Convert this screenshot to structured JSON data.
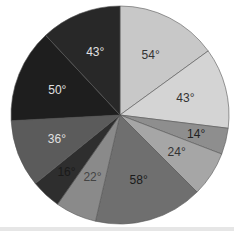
{
  "chart_data": {
    "type": "pie",
    "title": "",
    "unit": "°",
    "start_angle_deg": 0,
    "direction": "clockwise",
    "center": [
      120,
      115
    ],
    "radius": 109,
    "slices": [
      {
        "label": "54°",
        "value": 54,
        "color": "#c8c8c8",
        "text_color": "#333333"
      },
      {
        "label": "43°",
        "value": 43,
        "color": "#d4d4d4",
        "text_color": "#333333"
      },
      {
        "label": "14°",
        "value": 14,
        "color": "#8e8e8e",
        "text_color": "#222222"
      },
      {
        "label": "24°",
        "value": 24,
        "color": "#a6a6a6",
        "text_color": "#333333"
      },
      {
        "label": "58°",
        "value": 58,
        "color": "#6f6f6f",
        "text_color": "#1a1a1a"
      },
      {
        "label": "22°",
        "value": 22,
        "color": "#8a8a8a",
        "text_color": "#444444"
      },
      {
        "label": "16°",
        "value": 16,
        "color": "#2e2e2e",
        "text_color": "#1a1a1a"
      },
      {
        "label": "36°",
        "value": 36,
        "color": "#5b5b5b",
        "text_color": "#e0e0e0"
      },
      {
        "label": "50°",
        "value": 50,
        "color": "#1e1e1e",
        "text_color": "#e0e0e0"
      },
      {
        "label": "43°",
        "value": 43,
        "color": "#282828",
        "text_color": "#e0e0e0"
      }
    ],
    "values": [
      54,
      43,
      14,
      24,
      58,
      22,
      16,
      36,
      50,
      43
    ],
    "categories": [
      "54°",
      "43°",
      "14°",
      "24°",
      "58°",
      "22°",
      "16°",
      "36°",
      "50°",
      "43°"
    ],
    "legend": "none"
  }
}
